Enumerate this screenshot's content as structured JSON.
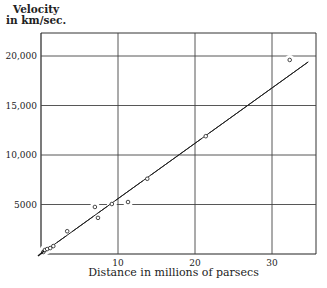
{
  "chart_data": {
    "type": "scatter",
    "title": "",
    "xlabel": "Distance in millions of parsecs",
    "ylabel": "Velocity in km/sec.",
    "ylabel_lines": [
      "Velocity",
      "in km/sec."
    ],
    "xlim": [
      0,
      35.5
    ],
    "ylim": [
      0,
      22000
    ],
    "x_ticks": [
      10,
      20,
      30
    ],
    "x_tick_labels": [
      "10",
      "20",
      "30"
    ],
    "y_ticks": [
      5000,
      10000,
      15000,
      20000
    ],
    "y_tick_labels": [
      "5000",
      "10,000",
      "15,000",
      "20,000"
    ],
    "grid": true,
    "legend": null,
    "series": [
      {
        "name": "observations",
        "marker": "open-circle",
        "x": [
          0.3,
          0.5,
          0.8,
          1.2,
          1.6,
          3.4,
          7.0,
          7.4,
          9.2,
          11.3,
          13.8,
          21.4,
          32.3
        ],
        "y": [
          200,
          400,
          500,
          600,
          800,
          2300,
          4750,
          3650,
          5050,
          5250,
          7600,
          11900,
          19600
        ]
      },
      {
        "name": "fit line",
        "type": "line",
        "x": [
          0,
          34.7
        ],
        "y": [
          0,
          19400
        ]
      }
    ]
  }
}
